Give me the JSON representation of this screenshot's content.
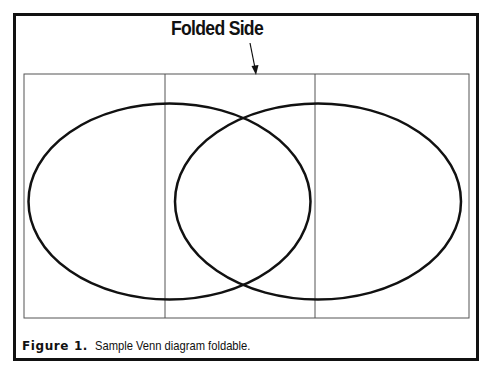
{
  "diagram": {
    "title": "Folded Side",
    "caption_label": "Figure 1.",
    "caption_text": "Sample Venn diagram foldable.",
    "panels": 3,
    "sheet": {
      "x": 24,
      "y": 74,
      "width": 445,
      "height": 244
    },
    "fold_lines_x": [
      165,
      315
    ],
    "ellipses": [
      {
        "name": "left-circle",
        "cx": 169.5,
        "cy": 201.5,
        "rx": 141,
        "ry": 98
      },
      {
        "name": "right-circle",
        "cx": 318,
        "cy": 201.5,
        "rx": 143,
        "ry": 98
      }
    ],
    "arrow": {
      "from": [
        250,
        43
      ],
      "to": [
        256,
        74
      ]
    },
    "colors": {
      "stroke": "#111111",
      "sheet_line": "#555555",
      "background": "#ffffff"
    }
  }
}
